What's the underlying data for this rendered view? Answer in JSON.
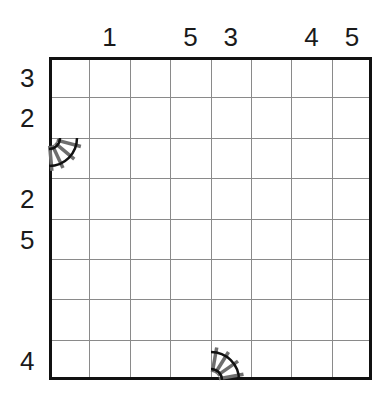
{
  "puzzle": {
    "type": "train-tracks",
    "size": 8,
    "column_clues": [
      "",
      "1",
      "",
      "5",
      "3",
      "",
      "4",
      "5"
    ],
    "row_clues": [
      "3",
      "2",
      "",
      "2",
      "5",
      "",
      "",
      "4"
    ],
    "given_tracks": [
      {
        "name": "curve-track-left-edge",
        "corner": "row3-top-left",
        "row": 3,
        "col": 1,
        "shape": "quarter-curve"
      },
      {
        "name": "curve-track-bottom-edge",
        "corner": "row8-bottom-left",
        "row": 8,
        "col": 5,
        "shape": "quarter-curve"
      }
    ]
  },
  "colors": {
    "border": "#111111",
    "gridline": "#8a8a8a",
    "rail": "#111111",
    "tie": "#6e6e6e",
    "background": "#ffffff"
  }
}
